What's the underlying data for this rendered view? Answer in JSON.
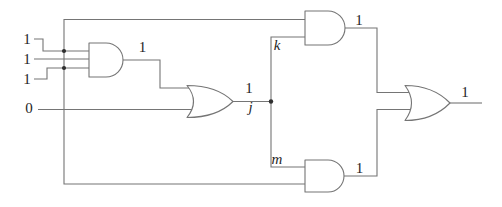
{
  "diagram": {
    "type": "combinational-logic-circuit",
    "background": "#ffffff",
    "wire_color": "#757575",
    "label_color": "#1f1f1f",
    "gate_count": 5
  },
  "labels": {
    "input1": "1",
    "input2": "1",
    "input3": "1",
    "input0": "0",
    "and1_output": "1",
    "or1_output": "1",
    "node_j": "j",
    "node_k": "k",
    "node_m": "m",
    "and2_output": "1",
    "and3_output": "1",
    "or2_output": "1"
  },
  "gates": [
    {
      "id": "and1",
      "type": "AND"
    },
    {
      "id": "or1",
      "type": "OR"
    },
    {
      "id": "and2",
      "type": "AND"
    },
    {
      "id": "and3",
      "type": "AND"
    },
    {
      "id": "or2",
      "type": "OR"
    }
  ]
}
